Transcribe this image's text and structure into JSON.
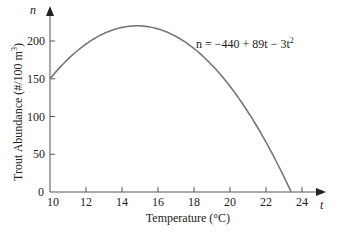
{
  "chart_data": {
    "type": "line",
    "title": "",
    "xlabel": "Temperature (°C)",
    "ylabel": "Trout Abundance (#/100 m³)",
    "x_axis_var": "t",
    "y_axis_var": "n",
    "xlim": [
      10,
      24.8
    ],
    "ylim": [
      0,
      230
    ],
    "x_ticks": [
      10,
      12,
      14,
      16,
      18,
      20,
      22,
      24
    ],
    "y_ticks": [
      0,
      50,
      100,
      150,
      200
    ],
    "grid": false,
    "legend": null,
    "annotations": [
      {
        "text": "n = −440 + 89t − 3t²",
        "position": "upper right"
      }
    ],
    "series": [
      {
        "name": "n = −440 + 89t − 3t²",
        "color": "#777777",
        "x": [
          10,
          11,
          12,
          13,
          14,
          14.83,
          15,
          16,
          17,
          18,
          19,
          20,
          21,
          22,
          23,
          23.4
        ],
        "y": [
          150,
          176,
          196,
          210,
          218,
          220,
          220,
          216,
          206,
          190,
          168,
          140,
          106,
          66,
          20,
          0
        ]
      }
    ]
  },
  "labels": {
    "y_var": "n",
    "x_var": "t",
    "equation_prefix": "n = −440 + 89t − 3t",
    "equation_exp": "2",
    "xlabel": "Temperature (°C)",
    "ylabel_main": "Trout Abundance (#/100 m",
    "ylabel_exp": "3",
    "ylabel_close": ")"
  }
}
